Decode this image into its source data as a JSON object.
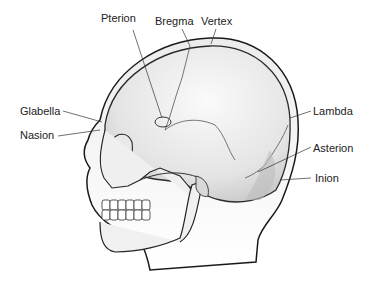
{
  "figure": {
    "labels": {
      "pterion": "Pterion",
      "bregma": "Bregma",
      "vertex": "Vertex",
      "glabella": "Glabella",
      "nasion": "Nasion",
      "lambda": "Lambda",
      "asterion": "Asterion",
      "inion": "Inion"
    }
  }
}
